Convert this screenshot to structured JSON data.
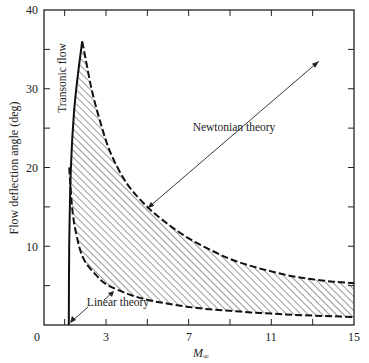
{
  "chart_data": {
    "type": "area",
    "title": "",
    "xlabel": "M∞",
    "ylabel": "Flow deflection angle (deg)",
    "xlim": [
      0,
      15
    ],
    "ylim": [
      0,
      40
    ],
    "x_ticks": [
      0,
      3,
      7,
      11,
      15
    ],
    "x_minor_ticks": [
      1,
      5,
      9,
      13
    ],
    "y_ticks": [
      0,
      10,
      20,
      30,
      40
    ],
    "y_minor_ticks": [
      5,
      15,
      25,
      35
    ],
    "grid": false,
    "series": [
      {
        "name": "Transonic flow",
        "style": "solid",
        "x": [
          1.2,
          1.22,
          1.3,
          1.45,
          1.65,
          1.85
        ],
        "y": [
          0,
          10,
          20,
          27,
          32,
          36
        ]
      },
      {
        "name": "Newtonian theory (upper bound)",
        "style": "dashed",
        "x": [
          1.85,
          2.0,
          2.3,
          2.7,
          3.2,
          4.0,
          5.0,
          6.0,
          7.0,
          8.0,
          9.0,
          10.0,
          11.0,
          12.0,
          13.0,
          14.0,
          15.0
        ],
        "y": [
          36,
          34,
          30,
          26,
          22,
          18,
          15,
          12.8,
          11.0,
          9.6,
          8.4,
          7.5,
          6.8,
          6.2,
          5.8,
          5.5,
          5.3
        ]
      },
      {
        "name": "Linear theory (lower bound)",
        "style": "dashed",
        "x": [
          1.22,
          1.4,
          1.7,
          2.0,
          2.5,
          3.0,
          4.0,
          5.0,
          6.0,
          7.0,
          8.0,
          9.0,
          10.0,
          11.0,
          12.0,
          13.0,
          14.0,
          15.0
        ],
        "y": [
          20,
          14,
          10,
          8.0,
          6.4,
          5.2,
          4.0,
          3.2,
          2.7,
          2.3,
          2.0,
          1.8,
          1.6,
          1.45,
          1.3,
          1.2,
          1.1,
          1.0
        ]
      }
    ],
    "shaded_region": "hatched area between Newtonian theory and Linear theory curves",
    "annotations": [
      {
        "text": "Transonic flow",
        "orientation": "vertical",
        "near": [
          1.4,
          31
        ]
      },
      {
        "text": "Newtonian theory",
        "arrow_from": [
          5.0,
          14.8
        ],
        "arrow_to": [
          13.3,
          33.5
        ],
        "label_at": [
          8.8,
          23.5
        ]
      },
      {
        "text": "Linear theory",
        "arrow_to": [
          1.25,
          0.2
        ],
        "label_at": [
          3.5,
          3.5
        ],
        "second_arrow_to": [
          3.6,
          4.6
        ]
      }
    ]
  },
  "labels": {
    "x_axis": "M",
    "x_axis_sub": "∞",
    "y_axis": "Flow deflection angle (deg)",
    "transonic": "Transonic flow",
    "newtonian": "Newtonian theory",
    "linear": "Linear theory",
    "x_ticks": [
      "0",
      "3",
      "7",
      "11",
      "15"
    ],
    "y_ticks": [
      "40",
      "30",
      "20",
      "10"
    ]
  }
}
